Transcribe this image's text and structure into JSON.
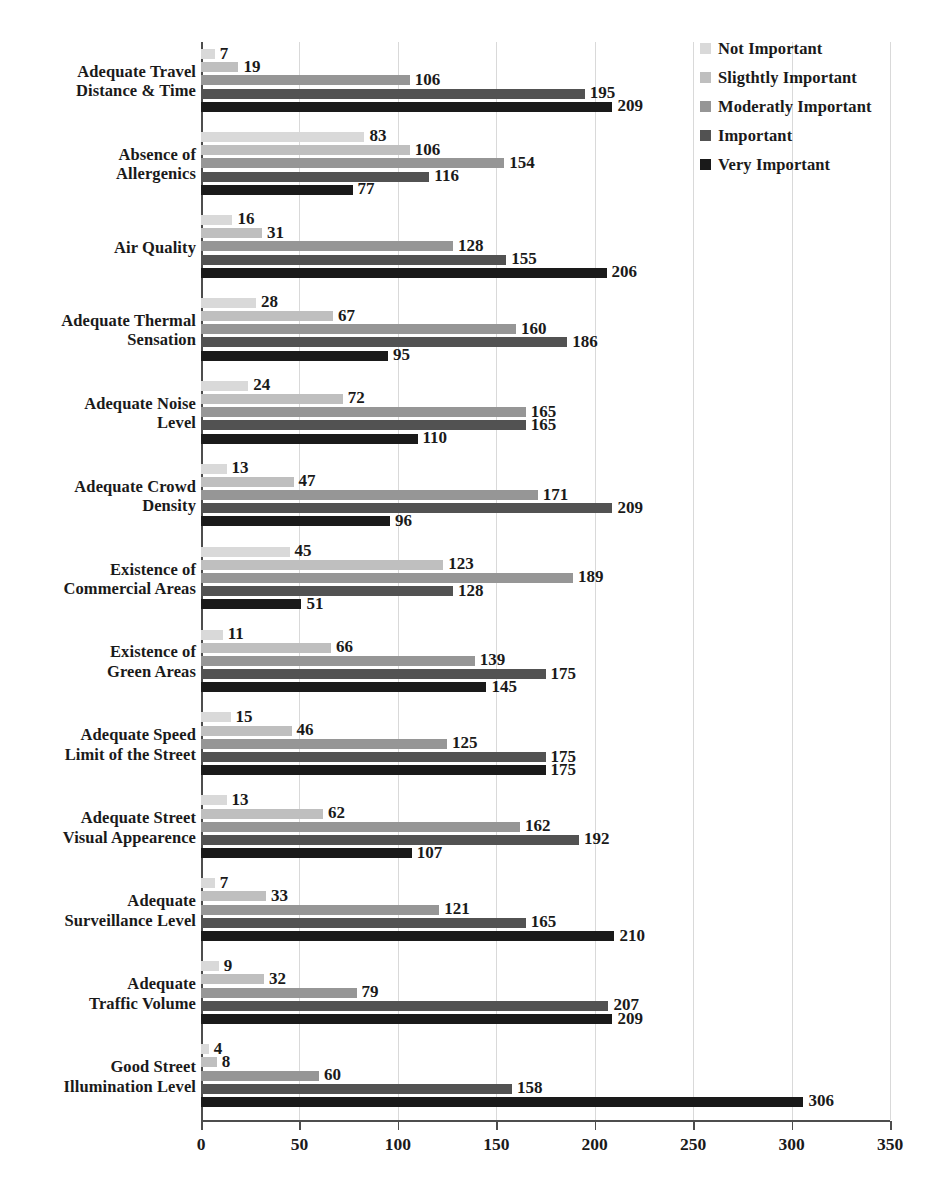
{
  "chart_data": {
    "type": "bar",
    "orientation": "horizontal",
    "title": "",
    "xlabel": "",
    "ylabel": "",
    "xlim": [
      0,
      350
    ],
    "xticks": [
      0,
      50,
      100,
      150,
      200,
      250,
      300,
      350
    ],
    "grid": true,
    "legend_position": "top-right",
    "series": [
      {
        "name": "Not Important",
        "color": "#d9d9d9",
        "values": [
          7,
          83,
          16,
          28,
          24,
          13,
          45,
          11,
          15,
          13,
          7,
          9,
          4
        ]
      },
      {
        "name": "Sligthtly Important",
        "color": "#bfbfbf",
        "values": [
          19,
          106,
          31,
          67,
          72,
          47,
          123,
          66,
          46,
          62,
          33,
          32,
          8
        ]
      },
      {
        "name": "Moderatly Important",
        "color": "#969696",
        "values": [
          106,
          154,
          128,
          160,
          165,
          171,
          189,
          139,
          125,
          162,
          121,
          79,
          60
        ]
      },
      {
        "name": "Important",
        "color": "#525252",
        "values": [
          195,
          116,
          155,
          186,
          165,
          209,
          128,
          175,
          175,
          192,
          165,
          207,
          158
        ]
      },
      {
        "name": "Very Important",
        "color": "#1a1a1a",
        "values": [
          209,
          77,
          206,
          95,
          110,
          96,
          51,
          145,
          175,
          107,
          210,
          209,
          306
        ]
      }
    ],
    "categories": [
      "Adequate Travel Distance & Time",
      "Absence of Allergenics",
      "Air Quality",
      "Adequate Thermal Sensation",
      "Adequate Noise Level",
      "Adequate Crowd Density",
      "Existence of Commercial Areas",
      "Existence of Green Areas",
      "Adequate Speed Limit of the Street",
      "Adequate Street Visual Appearence",
      "Adequate Surveillance Level",
      "Adequate Traffic Volume",
      "Good Street Illumination Level"
    ],
    "category_lines": [
      [
        "Adequate Travel",
        "Distance & Time"
      ],
      [
        "Absence of",
        "Allergenics"
      ],
      [
        "Air Quality"
      ],
      [
        "Adequate Thermal",
        "Sensation"
      ],
      [
        "Adequate Noise",
        "Level"
      ],
      [
        "Adequate Crowd",
        "Density"
      ],
      [
        "Existence of",
        "Commercial Areas"
      ],
      [
        "Existence of",
        "Green Areas"
      ],
      [
        "Adequate Speed",
        "Limit of the Street"
      ],
      [
        "Adequate Street",
        "Visual Appearence"
      ],
      [
        "Adequate",
        "Surveillance Level"
      ],
      [
        "Adequate",
        "Traffic Volume"
      ],
      [
        "Good Street",
        "Illumination Level"
      ]
    ]
  }
}
